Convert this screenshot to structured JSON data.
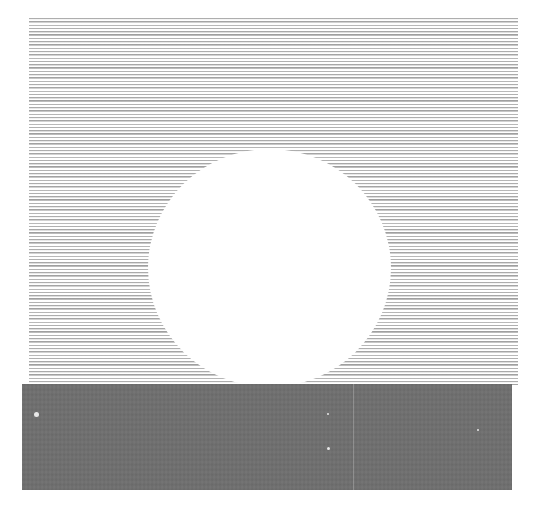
{
  "artwork": {
    "description": "Abstract composition: horizontal fine-line stripe field with a white circle cut out, above a solid gray rectangle",
    "colors": {
      "background": "#ffffff",
      "stripes": "#9a9a9a",
      "circle": "#ffffff",
      "block": "#6f6f6f",
      "specks": "#e8e8e8"
    },
    "stripe_field": {
      "x": 29,
      "y": 18,
      "width": 489,
      "height": 367,
      "line_period_px": 3.3
    },
    "circle": {
      "cx": 269,
      "cy": 268,
      "rx": 121,
      "ry": 119
    },
    "gray_block": {
      "x": 22,
      "y": 384,
      "width": 490,
      "height": 106
    },
    "specks": [
      {
        "x": 36,
        "y": 414,
        "r": 2.5
      },
      {
        "x": 328,
        "y": 448,
        "r": 1.2
      },
      {
        "x": 328,
        "y": 414,
        "r": 1
      },
      {
        "x": 478,
        "y": 430,
        "r": 1
      }
    ]
  }
}
